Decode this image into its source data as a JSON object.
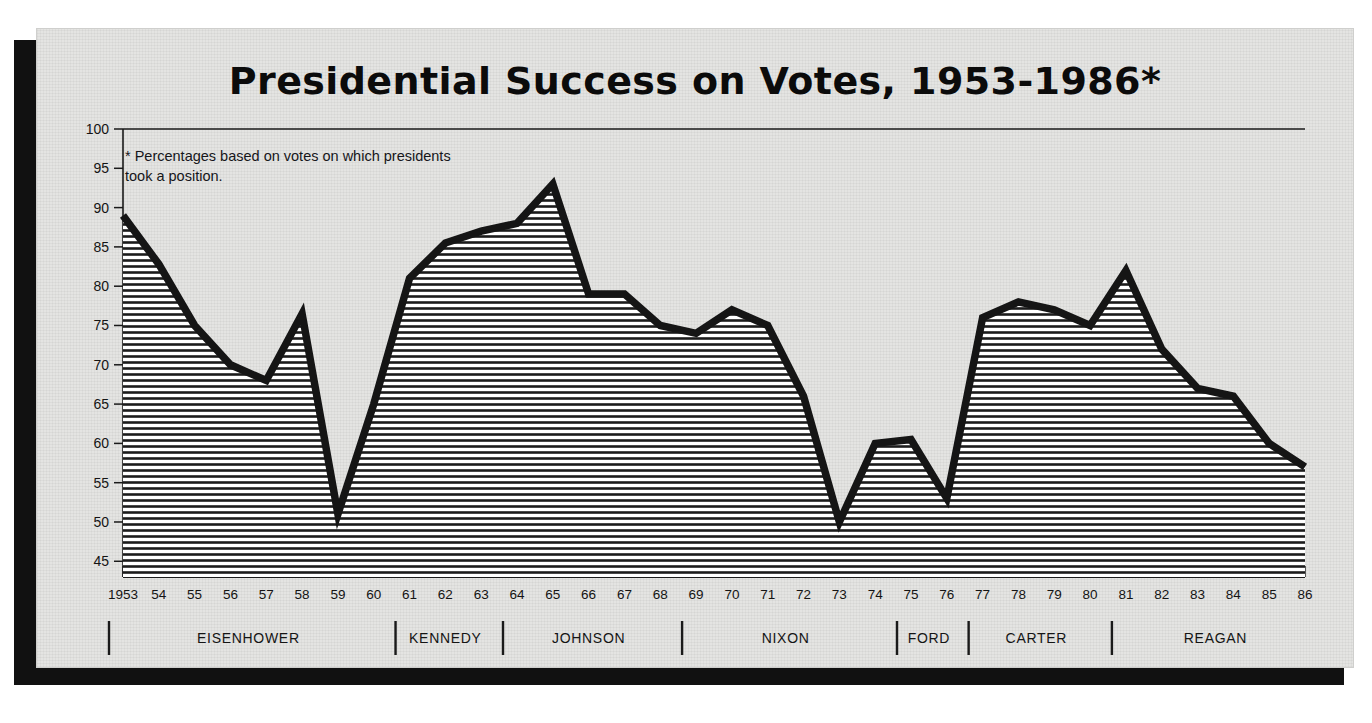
{
  "figure": {
    "title": "Presidential Success on Votes, 1953-1986*",
    "footnote": "* Percentages based on votes on which presidents took a position."
  },
  "chart_data": {
    "type": "area",
    "title": "Presidential Success on Votes, 1953-1986*",
    "xlabel": "",
    "ylabel": "",
    "ylim": [
      43,
      100
    ],
    "xlim": [
      1953,
      1986
    ],
    "yticks": [
      45,
      50,
      55,
      60,
      65,
      70,
      75,
      80,
      85,
      90,
      95,
      100
    ],
    "grid": false,
    "legend": "none",
    "annotations": [
      "* Percentages based on votes on which presidents took a position."
    ],
    "x": [
      1953,
      1954,
      1955,
      1956,
      1957,
      1958,
      1959,
      1960,
      1961,
      1962,
      1963,
      1964,
      1965,
      1966,
      1967,
      1968,
      1969,
      1970,
      1971,
      1972,
      1973,
      1974,
      1975,
      1976,
      1977,
      1978,
      1979,
      1980,
      1981,
      1982,
      1983,
      1984,
      1985,
      1986
    ],
    "xtick_labels": [
      "1953",
      "54",
      "55",
      "56",
      "57",
      "58",
      "59",
      "60",
      "61",
      "62",
      "63",
      "64",
      "65",
      "66",
      "67",
      "68",
      "69",
      "70",
      "71",
      "72",
      "73",
      "74",
      "75",
      "76",
      "77",
      "78",
      "79",
      "80",
      "81",
      "82",
      "83",
      "84",
      "85",
      "86"
    ],
    "values": [
      89.0,
      82.8,
      75.0,
      70.0,
      68.0,
      76.5,
      51.0,
      65.0,
      81.0,
      85.5,
      87.0,
      88.0,
      93.0,
      79.0,
      79.0,
      75.0,
      74.0,
      77.0,
      75.0,
      66.0,
      50.0,
      60.0,
      60.5,
      53.0,
      76.0,
      78.0,
      77.0,
      75.0,
      82.0,
      72.0,
      67.0,
      66.0,
      60.0,
      57.0
    ],
    "series": [
      {
        "name": "Presidential success rate (%)",
        "values": [
          89.0,
          82.8,
          75.0,
          70.0,
          68.0,
          76.5,
          51.0,
          65.0,
          81.0,
          85.5,
          87.0,
          88.0,
          93.0,
          79.0,
          79.0,
          75.0,
          74.0,
          77.0,
          75.0,
          66.0,
          50.0,
          60.0,
          60.5,
          53.0,
          76.0,
          78.0,
          77.0,
          75.0,
          82.0,
          72.0,
          67.0,
          66.0,
          60.0,
          57.0
        ]
      }
    ],
    "presidents": [
      {
        "name": "EISENHOWER",
        "start": 1953,
        "end": 1960
      },
      {
        "name": "KENNEDY",
        "start": 1961,
        "end": 1963
      },
      {
        "name": "JOHNSON",
        "start": 1964,
        "end": 1968
      },
      {
        "name": "NIXON",
        "start": 1969,
        "end": 1974
      },
      {
        "name": "FORD",
        "start": 1975,
        "end": 1976
      },
      {
        "name": "CARTER",
        "start": 1977,
        "end": 1980
      },
      {
        "name": "REAGAN",
        "start": 1981,
        "end": 1986
      }
    ],
    "colors": {
      "line": "#151515",
      "fill": "#ffffff",
      "background": "#e4e4e2",
      "axis": "#1a1a1a"
    }
  }
}
